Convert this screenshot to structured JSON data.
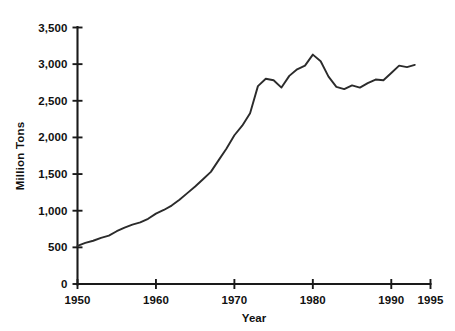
{
  "chart_data": {
    "type": "line",
    "title": "",
    "subtitle": "",
    "xlabel": "Year",
    "ylabel": "Million Tons",
    "xlim": [
      1950,
      1995
    ],
    "ylim": [
      0,
      3500
    ],
    "grid": false,
    "legend": false,
    "legend_position": "none",
    "xticks": [
      1950,
      1960,
      1970,
      1980,
      1990,
      1995
    ],
    "xtick_labels": [
      "1950",
      "1960",
      "1970",
      "1980",
      "1990",
      "1995"
    ],
    "yticks": [
      0,
      500,
      1000,
      1500,
      2000,
      2500,
      3000,
      3500
    ],
    "ytick_labels": [
      "0",
      "500",
      "1,000",
      "1,500",
      "2,000",
      "2,500",
      "3,000",
      "3,500"
    ],
    "series": [
      {
        "name": "Production",
        "color": "#2b2b2b",
        "x": [
          1950,
          1951,
          1952,
          1953,
          1954,
          1955,
          1956,
          1957,
          1958,
          1959,
          1960,
          1961,
          1962,
          1963,
          1964,
          1965,
          1966,
          1967,
          1968,
          1969,
          1970,
          1971,
          1972,
          1973,
          1974,
          1975,
          1976,
          1977,
          1978,
          1979,
          1980,
          1981,
          1982,
          1983,
          1984,
          1985,
          1986,
          1987,
          1988,
          1989,
          1990,
          1991,
          1992,
          1993
        ],
        "values": [
          520,
          560,
          590,
          630,
          660,
          720,
          770,
          810,
          840,
          890,
          960,
          1010,
          1070,
          1150,
          1240,
          1330,
          1430,
          1530,
          1690,
          1850,
          2030,
          2160,
          2330,
          2700,
          2800,
          2780,
          2680,
          2840,
          2930,
          2980,
          3130,
          3040,
          2830,
          2690,
          2660,
          2710,
          2680,
          2740,
          2790,
          2780,
          2880,
          2980,
          2960,
          2990
        ]
      }
    ]
  },
  "axis": {
    "y_title": "Million Tons",
    "x_title": "Year"
  }
}
